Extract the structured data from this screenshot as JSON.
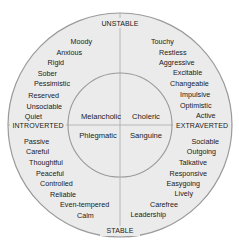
{
  "diagram": {
    "colors": {
      "outer_fill": "#ebebeb",
      "inner_fill": "#ebebeb",
      "stroke": "#9a9a9a",
      "text": "#1a1a1a"
    },
    "axes": {
      "top": "UNSTABLE",
      "bottom": "STABLE",
      "left": "INTROVERTED",
      "right": "EXTRAVERTED"
    },
    "temperaments": {
      "top_left": "Melancholic",
      "top_right": "Choleric",
      "bottom_left": "Phlegmatic",
      "bottom_right": "Sanguine"
    },
    "traits": {
      "top_left": [
        "Moody",
        "Anxious",
        "Rigid",
        "Sober",
        "Pessimistic",
        "Reserved",
        "Unsociable",
        "Quiet"
      ],
      "top_right": [
        "Touchy",
        "Restless",
        "Aggressive",
        "Excitable",
        "Changeable",
        "Impulsive",
        "Optimistic",
        "Active"
      ],
      "bottom_left": [
        "Passive",
        "Careful",
        "Thoughtful",
        "Peaceful",
        "Controlled",
        "Reliable",
        "Even-tempered",
        "Calm"
      ],
      "bottom_right": [
        "Sociable",
        "Outgoing",
        "Talkative",
        "Responsive",
        "Easygoing",
        "Lively",
        "Carefree",
        "Leadership"
      ]
    }
  }
}
